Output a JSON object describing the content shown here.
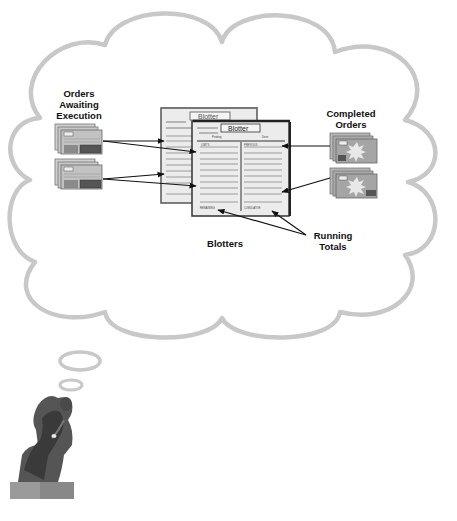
{
  "diagram": {
    "type": "thought-bubble",
    "labels": {
      "orders_awaiting": [
        "Orders",
        "Awaiting",
        "Execution"
      ],
      "completed_orders": [
        "Completed",
        "Orders"
      ],
      "blotters": "Blotters",
      "running_totals": [
        "Running",
        "Totals"
      ]
    },
    "blotter_back": {
      "title": "Blotter",
      "instrument_label": "Instrument",
      "pending_label": "Pendi"
    },
    "blotter_front": {
      "title": "Blotter",
      "instrument_label": "Instrument",
      "pending_header": "Pending",
      "done_header": "Done",
      "left_col_label": "LIMITS",
      "right_col_label": "PREVIOUS",
      "left_footer": "REMAINING",
      "right_footer": "CUMULATIVE"
    },
    "thinker": "thinker-statue",
    "colors": {
      "cloud_outline": "#c8c8c8",
      "paper": "#eeeeee",
      "ticket": "#b8b8b8",
      "arrow": "#111111"
    }
  }
}
